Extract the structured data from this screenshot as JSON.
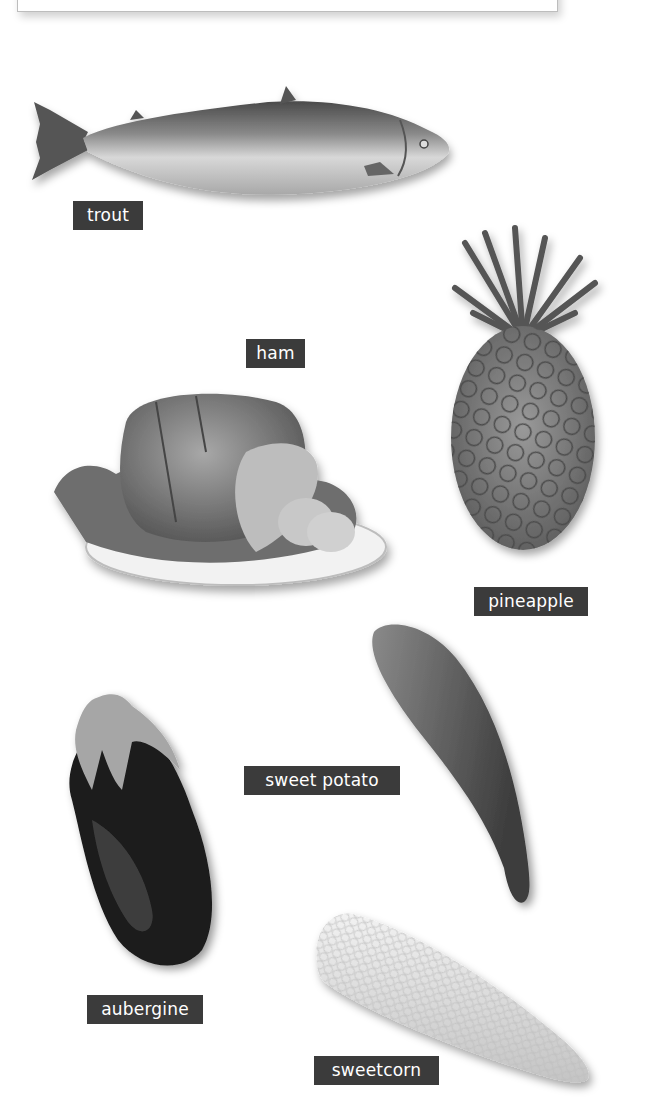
{
  "page": {
    "type": "picture dictionary",
    "palette": {
      "label_bg": "#3b3b3b",
      "label_text": "#ffffff",
      "background": "#ffffff"
    }
  },
  "items": [
    {
      "id": "trout",
      "label": "trout",
      "image": "trout-image"
    },
    {
      "id": "ham",
      "label": "ham",
      "image": "ham-image"
    },
    {
      "id": "pineapple",
      "label": "pineapple",
      "image": "pineapple-image"
    },
    {
      "id": "sweet-potato",
      "label": "sweet potato",
      "image": "sweet-potato-image"
    },
    {
      "id": "aubergine",
      "label": "aubergine",
      "image": "aubergine-image"
    },
    {
      "id": "sweetcorn",
      "label": "sweetcorn",
      "image": "sweetcorn-image"
    }
  ]
}
